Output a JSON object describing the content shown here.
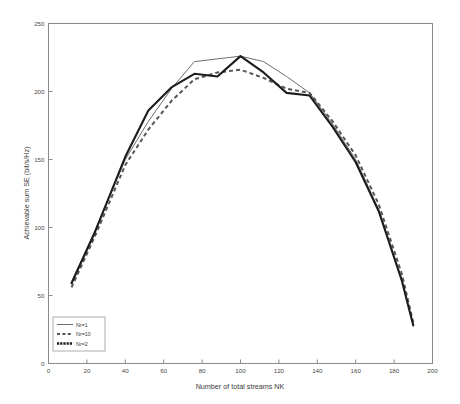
{
  "chart_data": {
    "type": "line",
    "title": "",
    "xlabel": "Number of total streams NK",
    "ylabel": "Achievable sum SE (bit/s/Hz)",
    "xlim": [
      0,
      200
    ],
    "ylim": [
      0,
      250
    ],
    "xticks": [
      0,
      20,
      40,
      60,
      80,
      100,
      120,
      140,
      160,
      180,
      200
    ],
    "yticks": [
      0,
      50,
      100,
      150,
      200,
      250
    ],
    "grid": false,
    "legend_position": "lower-left",
    "x": [
      12,
      24,
      40,
      52,
      64,
      76,
      88,
      100,
      112,
      124,
      136,
      148,
      160,
      172,
      184,
      190
    ],
    "series": [
      {
        "name": "Nr=1",
        "style": "solid-thin",
        "color": "#6f6f6f",
        "values": [
          60,
          97,
          150,
          178,
          202,
          222,
          224,
          226,
          222,
          211,
          199,
          176,
          150,
          113,
          62,
          28
        ]
      },
      {
        "name": "Nr=10",
        "style": "dashed",
        "color": "#555555",
        "values": [
          56,
          93,
          146,
          172,
          193,
          209,
          214,
          216,
          210,
          202,
          199,
          178,
          153,
          117,
          66,
          30
        ]
      },
      {
        "name": "Nr=2",
        "style": "solid-thick",
        "color": "#1c1c1c",
        "values": [
          59,
          96,
          152,
          186,
          203,
          213,
          211,
          226,
          214,
          199,
          197,
          174,
          148,
          112,
          61,
          28
        ]
      }
    ]
  },
  "legend": {
    "entries": [
      {
        "label": "Nr=1"
      },
      {
        "label": "Nr=10"
      },
      {
        "label": "Nr=2"
      }
    ]
  },
  "axis": {
    "y_tick_labels": [
      "0",
      "50",
      "100",
      "150",
      "200",
      "250"
    ],
    "x_tick_labels": [
      "0",
      "20",
      "40",
      "60",
      "80",
      "100",
      "120",
      "140",
      "160",
      "180",
      "200"
    ]
  }
}
